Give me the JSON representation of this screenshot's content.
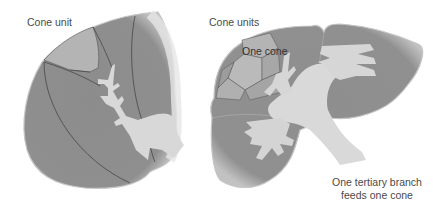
{
  "figure": {
    "left_panel": {
      "label": "Cone unit"
    },
    "right_panel": {
      "label_units": "Cone units",
      "label_cone": "One cone",
      "caption_line1": "One tertiary branch",
      "caption_line2": "feeds one cone"
    },
    "colors": {
      "organ_fill": "#8f8f8f",
      "organ_edge": "#c8c8c8",
      "vessel_fill": "#d9d9d9",
      "cone_fill": "#b5b5b5",
      "divider_line": "#3c3c3c",
      "text": "#4a4a4a"
    }
  }
}
